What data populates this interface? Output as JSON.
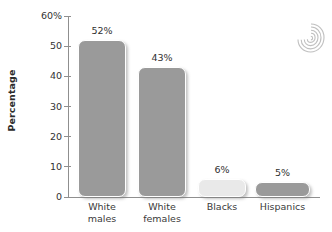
{
  "chart_data": {
    "type": "bar",
    "title": "",
    "xlabel": "",
    "ylabel": "Percentage",
    "categories": [
      "White males",
      "White females",
      "Blacks",
      "Hispanics"
    ],
    "category_lines": [
      [
        "White",
        "males"
      ],
      [
        "White",
        "females"
      ],
      [
        "Blacks",
        ""
      ],
      [
        "Hispanics",
        ""
      ]
    ],
    "values": [
      52,
      43,
      6,
      5
    ],
    "value_labels": [
      "52%",
      "43%",
      "6%",
      "5%"
    ],
    "ylim": [
      0,
      60
    ],
    "ytick_values": [
      0,
      10,
      20,
      30,
      40,
      50,
      60
    ],
    "ytick_labels": [
      "0",
      "10",
      "20",
      "30",
      "40",
      "50",
      "60%"
    ],
    "grid": false,
    "legend": null,
    "bar_colors": [
      "#9a9a9a",
      "#9a9a9a",
      "#e9e9e9",
      "#9a9a9a"
    ]
  },
  "decoration": {
    "spiral_icon": "spiral-icon"
  },
  "axis": {
    "line_color": "#8f8f8f"
  }
}
